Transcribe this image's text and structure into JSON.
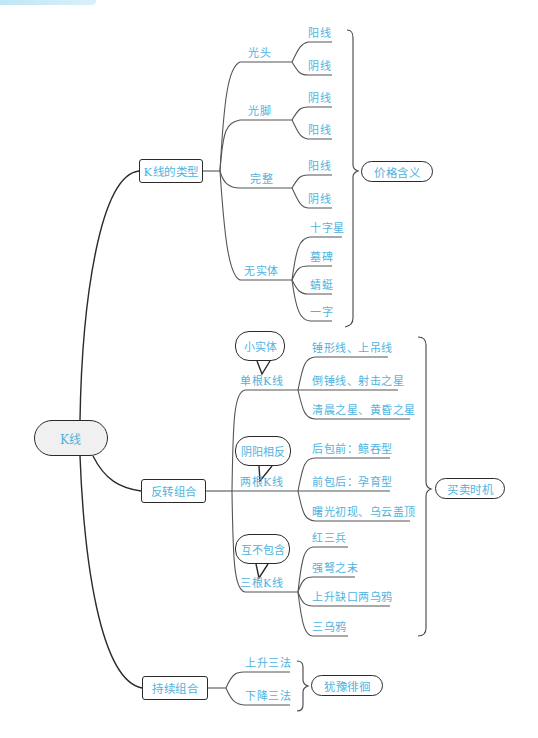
{
  "header_strip": {
    "color": "#bfe6f5"
  },
  "colors": {
    "text": "#4fb3de",
    "line": "#555555",
    "border": "#2a2a2a",
    "root_fill": "#f0f0f0"
  },
  "root": {
    "label": "K线"
  },
  "branches": [
    {
      "label": "K线的类型",
      "summary": "价格含义",
      "groups": [
        {
          "label": "光头",
          "items": [
            "阳线",
            "阴线"
          ]
        },
        {
          "label": "光脚",
          "items": [
            "阴线",
            "阳线"
          ]
        },
        {
          "label": "完整",
          "items": [
            "阳线",
            "阴线"
          ]
        },
        {
          "label": "无实体",
          "items": [
            "十字星",
            "墓碑",
            "蜻蜓",
            "一字"
          ]
        }
      ]
    },
    {
      "label": "反转组合",
      "summary": "买卖时机",
      "groups": [
        {
          "label": "单根K线",
          "callout": "小实体",
          "items": [
            "锤形线、上吊线",
            "倒锤线、射击之星",
            "清晨之星、黄昏之星"
          ]
        },
        {
          "label": "两根K线",
          "callout": "阴阳相反",
          "items": [
            "后包前：鲸吞型",
            "前包后：孕育型",
            "曙光初现、乌云盖顶"
          ]
        },
        {
          "label": "三根K线",
          "callout": "互不包含",
          "items": [
            "红三兵",
            "强弩之末",
            "上升缺口两乌鸦",
            "三乌鸦"
          ]
        }
      ]
    },
    {
      "label": "持续组合",
      "summary": "犹豫徘徊",
      "groups": [
        {
          "label": "上升三法"
        },
        {
          "label": "下降三法"
        }
      ]
    }
  ]
}
